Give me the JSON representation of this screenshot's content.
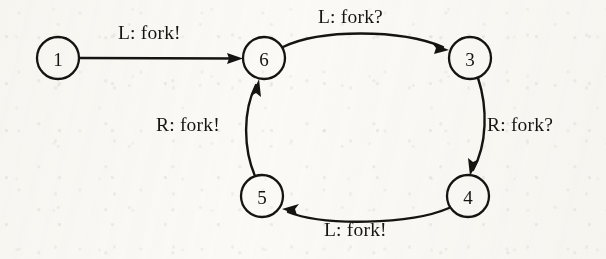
{
  "diagram": {
    "type": "state-transition-diagram",
    "ink_color": "#161412",
    "paper_color": "#fbfaf7",
    "nodes": [
      {
        "id": "1",
        "label": "1",
        "cx": 58,
        "cy": 58,
        "r": 21
      },
      {
        "id": "6",
        "label": "6",
        "cx": 264,
        "cy": 58,
        "r": 21
      },
      {
        "id": "3",
        "label": "3",
        "cx": 470,
        "cy": 58,
        "r": 21
      },
      {
        "id": "4",
        "label": "4",
        "cx": 468,
        "cy": 196,
        "r": 21
      },
      {
        "id": "5",
        "label": "5",
        "cx": 262,
        "cy": 196,
        "r": 21
      }
    ],
    "edges": [
      {
        "id": "e1",
        "from": "1",
        "to": "6",
        "label": "L: fork!",
        "label_x": 118,
        "label_y": 22
      },
      {
        "id": "e2",
        "from": "6",
        "to": "3",
        "label": "L: fork?",
        "label_x": 318,
        "label_y": 6
      },
      {
        "id": "e3",
        "from": "3",
        "to": "4",
        "label": "R: fork?",
        "label_x": 487,
        "label_y": 114
      },
      {
        "id": "e4",
        "from": "4",
        "to": "5",
        "label": "L: fork!",
        "label_x": 324,
        "label_y": 219
      },
      {
        "id": "e5",
        "from": "5",
        "to": "6",
        "label": "R: fork!",
        "label_x": 156,
        "label_y": 114
      }
    ]
  }
}
